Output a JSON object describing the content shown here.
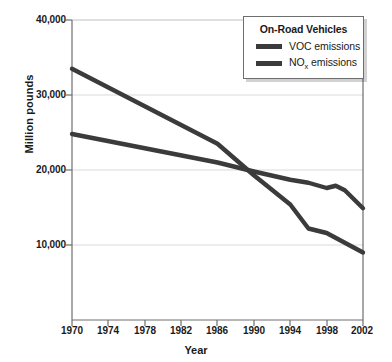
{
  "chart_data": {
    "type": "line",
    "title": "",
    "xlabel": "Year",
    "ylabel": "Million pounds",
    "xlim": [
      1970,
      2002
    ],
    "ylim": [
      0,
      40000
    ],
    "xticks": [
      "1970",
      "1974",
      "1978",
      "1982",
      "1986",
      "1990",
      "1994",
      "1998",
      "2002"
    ],
    "xtick_values": [
      1970,
      1974,
      1978,
      1982,
      1986,
      1990,
      1994,
      1998,
      2002
    ],
    "yticks": [
      "10,000",
      "20,000",
      "30,000",
      "40,000"
    ],
    "ytick_values": [
      10000,
      20000,
      30000,
      40000
    ],
    "grid": "horizontal",
    "legend_position": "top-right",
    "legend_title": "On-Road Vehicles",
    "x": [
      1970,
      1986,
      1990,
      1994,
      1996,
      1998,
      1999,
      2000,
      2002
    ],
    "series": [
      {
        "name": "VOC emissions",
        "label": "VOC emissions",
        "color": "#3b3b3b",
        "x": [
          1970,
          1986,
          1990,
          1994,
          1996,
          1998,
          2000,
          2002
        ],
        "values": [
          33500,
          23500,
          19300,
          15400,
          12200,
          11600,
          10300,
          9000
        ]
      },
      {
        "name": "NOx emissions",
        "label_prefix": "NO",
        "label_sub": "x",
        "label_suffix": " emissions",
        "label": "NOx emissions",
        "color": "#3b3b3b",
        "x": [
          1970,
          1986,
          1990,
          1994,
          1996,
          1998,
          1999,
          2000,
          2002
        ],
        "values": [
          24800,
          21000,
          19800,
          18700,
          18300,
          17600,
          17900,
          17300,
          14900
        ]
      }
    ]
  },
  "axes": {
    "y_title": "Million pounds",
    "x_title": "Year"
  },
  "legend": {
    "title": "On-Road Vehicles",
    "items": [
      {
        "label": "VOC emissions"
      },
      {
        "label_prefix": "NO",
        "label_sub": "x",
        "label_suffix": " emissions"
      }
    ]
  },
  "colors": {
    "line": "#3b3b3b",
    "axis": "#6e6e6e",
    "grid": "#d5d5d5",
    "text": "#1a1a1a",
    "background": "#ffffff"
  }
}
